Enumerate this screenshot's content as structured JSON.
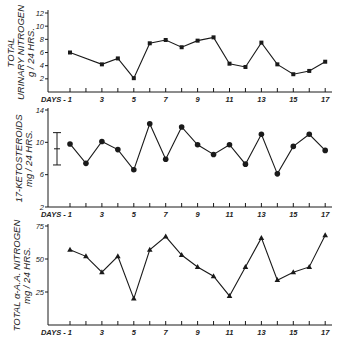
{
  "chart_data": [
    {
      "type": "line",
      "title": "",
      "xlabel": "DAYS",
      "ylabel": "TOTAL URINARY NITROGEN g/24 HRS.",
      "ylabel_lines": [
        "TOTAL",
        "URINARY NITROGEN",
        "g / 24  HRS."
      ],
      "marker": "square",
      "ylim": [
        0,
        12
      ],
      "yticks": [
        2,
        4,
        6,
        8,
        10,
        12
      ],
      "xlim": [
        1,
        17
      ],
      "xtick_labels": [
        "DAYS - 1",
        "3",
        "5",
        "7",
        "9",
        "11",
        "13",
        "15",
        "17"
      ],
      "x": [
        1,
        3,
        4,
        5,
        6,
        7,
        8,
        9,
        10,
        11,
        12,
        13,
        14,
        15,
        16,
        17
      ],
      "values": [
        6.0,
        4.2,
        5.1,
        2.1,
        7.4,
        7.9,
        6.8,
        7.8,
        8.3,
        4.3,
        3.8,
        7.5,
        4.2,
        2.7,
        3.2,
        4.6
      ],
      "grid": false
    },
    {
      "type": "line",
      "title": "",
      "xlabel": "DAYS",
      "ylabel": "17-KETOSTEROIDS mg/24 HRS.",
      "ylabel_lines": [
        "17-KETOSTEROIDS",
        "mg / 24  HRS."
      ],
      "marker": "circle",
      "ylim": [
        2,
        14
      ],
      "yticks": [
        2,
        6,
        10,
        14
      ],
      "xlim": [
        1,
        17
      ],
      "xtick_labels": [
        "DAYS - 1",
        "3",
        "5",
        "7",
        "9",
        "11",
        "13",
        "15",
        "17"
      ],
      "x": [
        1,
        2,
        3,
        4,
        5,
        6,
        7,
        8,
        9,
        10,
        11,
        12,
        13,
        14,
        15,
        16,
        17
      ],
      "values": [
        9.8,
        7.4,
        10.1,
        9.1,
        6.6,
        12.3,
        7.9,
        11.9,
        9.7,
        8.5,
        9.7,
        7.3,
        11.0,
        6.1,
        9.5,
        11.0,
        9.0
      ],
      "annotations": [
        {
          "type": "range_bar",
          "low": 7.2,
          "mid": 9.2,
          "high": 11.2,
          "description": "normal range indicator"
        }
      ],
      "grid": false
    },
    {
      "type": "line",
      "title": "",
      "xlabel": "DAYS",
      "ylabel": "TOTAL α-A.A. NITROGEN mg/24 HRS.",
      "ylabel_lines": [
        "TOTAL  α-A.A. NITROGEN",
        "mg / 24  HRS."
      ],
      "marker": "triangle",
      "ylim": [
        0,
        75
      ],
      "yticks": [
        25,
        50,
        75
      ],
      "xlim": [
        1,
        17
      ],
      "xtick_labels": [
        "DAYS - 1",
        "3",
        "5",
        "7",
        "9",
        "11",
        "13",
        "15",
        "17"
      ],
      "x": [
        1,
        2,
        3,
        4,
        5,
        6,
        7,
        8,
        9,
        10,
        11,
        12,
        13,
        14,
        15,
        16,
        17
      ],
      "values": [
        57,
        52,
        40,
        52,
        20,
        57,
        67,
        53,
        44,
        37,
        22,
        44,
        66,
        34,
        40,
        44,
        68
      ],
      "grid": false
    }
  ],
  "colors": {
    "ink": "#1a1a1a",
    "background": "#ffffff"
  }
}
